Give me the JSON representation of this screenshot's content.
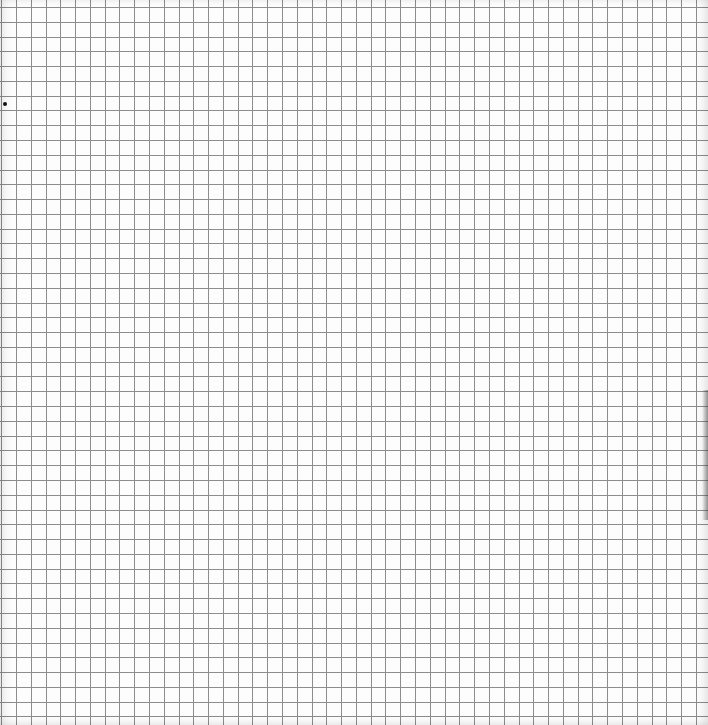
{
  "canvas": {
    "width": 708,
    "height": 725,
    "background": "#fdfdfd"
  },
  "grid": {
    "cell_size_px": 14.78,
    "origin_x": 16,
    "origin_y": 7,
    "line_color": "#8c8c8c",
    "line_width": 1,
    "columns": 47,
    "rows": 48
  },
  "marker": {
    "x": 5,
    "y": 104,
    "color": "#111111"
  },
  "edge_shadow": {
    "top": 390,
    "height": 130
  }
}
